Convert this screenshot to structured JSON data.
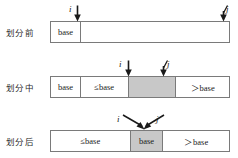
{
  "figure": {
    "background_color": "#ffffff",
    "border_color": "#7a7a7a",
    "shaded_color": "#c8c8c8",
    "text_color": "#1a1a1a",
    "pointer_names": {
      "i": "i",
      "j": "j"
    },
    "rows": [
      {
        "id": "before",
        "label": "划分前",
        "cells": [
          {
            "text": "base",
            "fill": "plain",
            "width_pct": 16.8
          },
          {
            "text": "",
            "fill": "plain",
            "width_pct": 83.2
          }
        ],
        "pointers": [
          {
            "name": "i",
            "kind": "vertical"
          },
          {
            "name": "j",
            "kind": "vertical"
          }
        ]
      },
      {
        "id": "during",
        "label": "划分中",
        "cells": [
          {
            "text": "base",
            "fill": "plain",
            "width_pct": 16.8
          },
          {
            "text": "≤base",
            "fill": "plain",
            "width_pct": 26.8
          },
          {
            "text": "",
            "fill": "shaded",
            "width_pct": 26.8
          },
          {
            "text": "＞base",
            "fill": "plain",
            "width_pct": 29.6
          }
        ],
        "pointers": [
          {
            "name": "i",
            "kind": "vertical"
          },
          {
            "name": "j",
            "kind": "vertical"
          }
        ]
      },
      {
        "id": "after",
        "label": "划分后",
        "cells": [
          {
            "text": "≤base",
            "fill": "plain",
            "width_pct": 44.7
          },
          {
            "text": "base",
            "fill": "shaded",
            "width_pct": 18.4
          },
          {
            "text": "＞base",
            "fill": "plain",
            "width_pct": 36.9
          }
        ],
        "pointers": [
          {
            "name": "i",
            "kind": "diagonal-right"
          },
          {
            "name": "j",
            "kind": "diagonal-left"
          }
        ]
      }
    ]
  }
}
